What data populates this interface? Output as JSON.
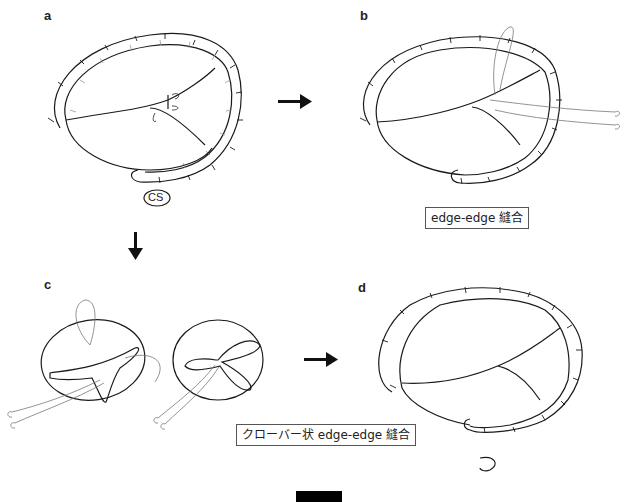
{
  "figure": {
    "panels": [
      {
        "id": "a",
        "label": "a",
        "annotation": "CS"
      },
      {
        "id": "b",
        "label": "b",
        "caption": "edge-edge 縫合"
      },
      {
        "id": "c",
        "label": "c"
      },
      {
        "id": "d",
        "label": "d",
        "caption": "クローバー状 edge-edge 縫合"
      }
    ],
    "arrows": [
      {
        "from": "a",
        "to": "b",
        "direction": "right"
      },
      {
        "from": "a",
        "to": "c",
        "direction": "down"
      },
      {
        "from": "c",
        "to": "d",
        "direction": "right"
      }
    ],
    "scale_bar": true,
    "colors": {
      "line": "#1a1a1a",
      "ring_hatch": "#999999",
      "suture": "#777777"
    }
  }
}
